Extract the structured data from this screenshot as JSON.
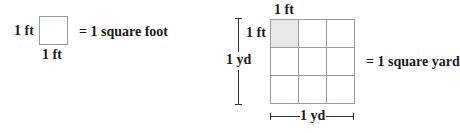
{
  "square_foot": {
    "side_label_left": "1 ft",
    "side_label_bottom": "1 ft",
    "equation": "= 1 square foot"
  },
  "square_yard": {
    "top_cell_label": "1 ft",
    "left_cell_label": "1 ft",
    "vertical_dimension_label": "1 yd",
    "horizontal_dimension_label": "1 yd",
    "equation": "= 1 square yard",
    "grid": {
      "rows": 3,
      "cols": 3,
      "shaded_cell": [
        0,
        0
      ]
    }
  },
  "colors": {
    "shade": "#e8e8e8",
    "grid_line": "#9a9a9a",
    "text": "#1a1a1a"
  }
}
